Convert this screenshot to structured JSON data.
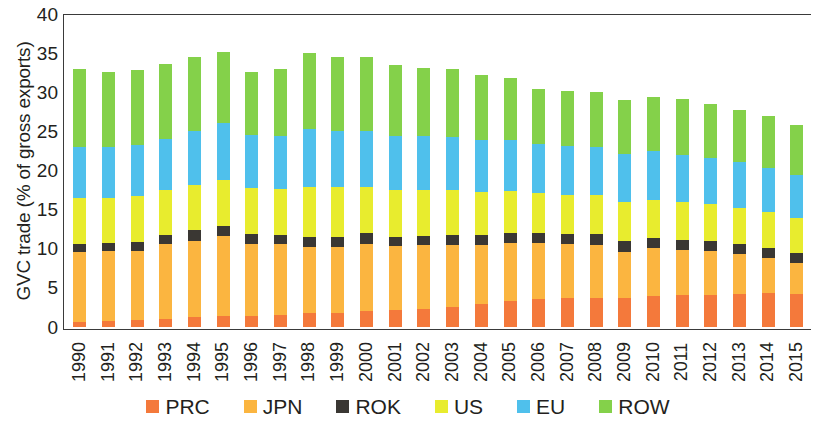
{
  "chart_data": {
    "type": "bar",
    "stacked": true,
    "title": "",
    "xlabel": "",
    "ylabel": "GVC trade (% of gross exports)",
    "ylim": [
      0,
      40
    ],
    "ytick_step": 5,
    "yticks": [
      "40",
      "35",
      "30",
      "25",
      "20",
      "15",
      "10",
      "5",
      "0"
    ],
    "grid": false,
    "legend_position": "bottom",
    "categories": [
      "1990",
      "1991",
      "1992",
      "1993",
      "1994",
      "1995",
      "1996",
      "1997",
      "1998",
      "1999",
      "2000",
      "2001",
      "2002",
      "2003",
      "2004",
      "2005",
      "2006",
      "2007",
      "2008",
      "2009",
      "2010",
      "2011",
      "2012",
      "2013",
      "2014",
      "2015"
    ],
    "series": [
      {
        "name": "PRC",
        "color": "#F4793B",
        "values": [
          0.7,
          0.8,
          0.9,
          1.1,
          1.3,
          1.5,
          1.5,
          1.6,
          1.8,
          1.9,
          2.1,
          2.2,
          2.4,
          2.6,
          3.0,
          3.4,
          3.6,
          3.7,
          3.8,
          3.7,
          4.0,
          4.1,
          4.2,
          4.3,
          4.4,
          4.3
        ]
      },
      {
        "name": "JPN",
        "color": "#FBB540",
        "values": [
          9.0,
          9.0,
          8.9,
          9.5,
          9.8,
          10.2,
          9.2,
          9.0,
          8.5,
          8.4,
          8.6,
          8.2,
          8.1,
          7.9,
          7.5,
          7.4,
          7.2,
          6.9,
          6.7,
          6.0,
          6.1,
          5.8,
          5.6,
          5.1,
          4.5,
          3.9
        ]
      },
      {
        "name": "ROK",
        "color": "#3A3733",
        "values": [
          1.0,
          1.0,
          1.1,
          1.2,
          1.3,
          1.3,
          1.2,
          1.2,
          1.2,
          1.3,
          1.3,
          1.2,
          1.2,
          1.3,
          1.3,
          1.3,
          1.3,
          1.3,
          1.4,
          1.3,
          1.3,
          1.3,
          1.3,
          1.3,
          1.3,
          1.3
        ]
      },
      {
        "name": "US",
        "color": "#E8EC2E",
        "values": [
          5.9,
          5.8,
          5.9,
          5.7,
          5.8,
          5.9,
          5.9,
          5.9,
          6.4,
          6.3,
          6.0,
          6.0,
          5.9,
          5.8,
          5.5,
          5.3,
          5.1,
          5.0,
          5.0,
          5.0,
          4.9,
          4.8,
          4.7,
          4.6,
          4.6,
          4.5
        ]
      },
      {
        "name": "EU",
        "color": "#4FC0EC",
        "values": [
          6.5,
          6.4,
          6.5,
          6.6,
          6.9,
          7.2,
          6.8,
          6.8,
          7.5,
          7.2,
          7.1,
          6.8,
          6.8,
          6.7,
          6.6,
          6.6,
          6.3,
          6.3,
          6.2,
          6.2,
          6.2,
          6.0,
          5.9,
          5.8,
          5.6,
          5.5
        ]
      },
      {
        "name": "ROW",
        "color": "#84D14A",
        "values": [
          9.9,
          9.7,
          9.6,
          9.5,
          9.5,
          9.1,
          8.1,
          8.5,
          9.7,
          9.5,
          9.5,
          9.1,
          8.8,
          8.7,
          8.4,
          7.9,
          7.0,
          7.0,
          7.0,
          6.8,
          7.0,
          7.2,
          6.9,
          6.7,
          6.6,
          6.4
        ]
      }
    ]
  },
  "legend": {
    "items": [
      {
        "label": "PRC",
        "color": "#F4793B"
      },
      {
        "label": "JPN",
        "color": "#FBB540"
      },
      {
        "label": "ROK",
        "color": "#3A3733"
      },
      {
        "label": "US",
        "color": "#E8EC2E"
      },
      {
        "label": "EU",
        "color": "#4FC0EC"
      },
      {
        "label": "ROW",
        "color": "#84D14A"
      }
    ]
  }
}
